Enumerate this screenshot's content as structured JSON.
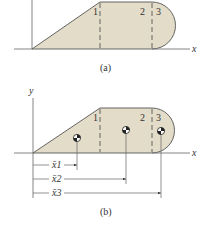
{
  "colors": {
    "fill": "#e3dcc8",
    "stroke": "#555555",
    "axis": "#666666",
    "dash": "#555555"
  },
  "panel_a": {
    "caption": "(a)",
    "x_axis_label": "x",
    "segment_labels": [
      "1",
      "2",
      "3"
    ]
  },
  "panel_b": {
    "caption": "(b)",
    "x_axis_label": "x",
    "y_axis_label": "y",
    "segment_labels": [
      "1",
      "2",
      "3"
    ],
    "dimensions": [
      {
        "label": "x̄1",
        "sub": "1"
      },
      {
        "label": "x̄2",
        "sub": "2"
      },
      {
        "label": "x̄3",
        "sub": "3"
      }
    ]
  }
}
